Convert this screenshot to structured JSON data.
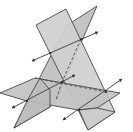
{
  "figure": {
    "title": "",
    "colors": {
      "background": "#ffffff",
      "plane_fill": "#c8c8c8",
      "plane_fill_dark": "#b4b4b4",
      "edge": "#4a4a4a"
    },
    "planes": [
      {
        "name": "tall-plane",
        "points": "36,25 66,9 115,112 88,130"
      },
      {
        "name": "slanted-plane",
        "points": "97,6 70,22 14,128 50,107 44,95"
      },
      {
        "name": "horizontal-plane",
        "points": "0,93 35,78 120,93 97,108 27,101"
      }
    ],
    "intersection_lines": [
      {
        "name": "upper-line",
        "x1": 32,
        "y1": 61,
        "x2": 98,
        "y2": 32
      },
      {
        "name": "middle-line",
        "x1": 12,
        "y1": 108,
        "x2": 75,
        "y2": 75
      },
      {
        "name": "lower-line",
        "x1": 63,
        "y1": 120,
        "x2": 122,
        "y2": 79
      }
    ],
    "intersection_points": [
      {
        "name": "point-1",
        "x": 50,
        "y": 53
      },
      {
        "name": "point-2",
        "x": 81,
        "y": 39
      },
      {
        "name": "point-3",
        "x": 62,
        "y": 82
      },
      {
        "name": "point-4",
        "x": 27,
        "y": 101
      },
      {
        "name": "point-5",
        "x": 106,
        "y": 92
      },
      {
        "name": "point-6",
        "x": 79,
        "y": 110
      }
    ]
  }
}
